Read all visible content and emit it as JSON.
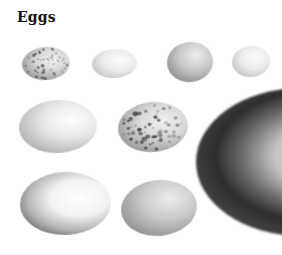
{
  "title": "Eggs",
  "eggs": [
    {
      "id": "egg-1",
      "row": 1,
      "col": 1,
      "x": 22,
      "y": 47,
      "w": 48,
      "h": 33,
      "tone": "speckled",
      "speckled": true,
      "rotate": -4
    },
    {
      "id": "egg-2",
      "row": 1,
      "col": 2,
      "x": 92,
      "y": 49,
      "w": 45,
      "h": 29,
      "tone": "pale",
      "speckled": false,
      "rotate": -3
    },
    {
      "id": "egg-3",
      "row": 1,
      "col": 3,
      "x": 167,
      "y": 42,
      "w": 46,
      "h": 40,
      "tone": "grey",
      "speckled": false,
      "rotate": -8
    },
    {
      "id": "egg-4",
      "row": 1,
      "col": 4,
      "x": 232,
      "y": 46,
      "w": 38,
      "h": 31,
      "tone": "pale",
      "speckled": false,
      "rotate": -6
    },
    {
      "id": "egg-5",
      "row": 2,
      "col": 1,
      "x": 19,
      "y": 100,
      "w": 78,
      "h": 53,
      "tone": "light",
      "speckled": false,
      "rotate": -3
    },
    {
      "id": "egg-6",
      "row": 2,
      "col": 2,
      "x": 118,
      "y": 102,
      "w": 70,
      "h": 50,
      "tone": "speckled",
      "speckled": true,
      "rotate": -5
    },
    {
      "id": "egg-7",
      "row": 3,
      "col": 1,
      "x": 20,
      "y": 172,
      "w": 91,
      "h": 63,
      "tone": "shadowed",
      "speckled": false,
      "rotate": -2
    },
    {
      "id": "egg-8",
      "row": 3,
      "col": 2,
      "x": 121,
      "y": 180,
      "w": 76,
      "h": 56,
      "tone": "grey",
      "speckled": false,
      "rotate": -6
    },
    {
      "id": "egg-large",
      "row": 2,
      "col": 3,
      "x": 196,
      "y": 88,
      "w": 210,
      "h": 148,
      "tone": "large-dark",
      "speckled": false,
      "rotate": 0
    }
  ]
}
